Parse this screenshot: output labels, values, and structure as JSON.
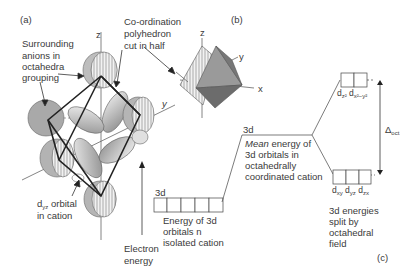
{
  "panel_labels": {
    "a": "(a)",
    "b": "(b)",
    "c": "(c)"
  },
  "part_a": {
    "axis_z": "z",
    "axis_y": "y",
    "label_anions": [
      "Surrounding",
      "anions in",
      "octahedra",
      "grouping"
    ],
    "label_polyhedron": [
      "Co-ordination",
      "polyhedron",
      "cut in half"
    ],
    "label_orbital_prefix": "d",
    "label_orbital_sub": "yz",
    "label_orbital_suffix": " orbital",
    "label_orbital_line2": "in cation"
  },
  "part_b": {
    "axis_z": "z",
    "axis_y": "y",
    "axis_x": "x"
  },
  "part_c": {
    "energy_axis_label": [
      "Electron",
      "energy"
    ],
    "isolated": {
      "level_label": "3d",
      "box_count": 5,
      "caption": [
        "Energy of 3d",
        "orbitals n",
        "isolated cation"
      ]
    },
    "mean": {
      "level_label": "3d",
      "caption_italic": "Mean",
      "caption_rest": " energy of",
      "caption_lines": [
        "3d orbitals in",
        "octahedrally",
        "coordinated cation"
      ]
    },
    "eg": {
      "box_count": 2,
      "orbitals": [
        {
          "d": "d",
          "sub": "z²"
        },
        {
          "d": "d",
          "sub": "x²−y²"
        }
      ]
    },
    "t2g": {
      "box_count": 3,
      "orbitals": [
        {
          "d": "d",
          "sub": "xy"
        },
        {
          "d": "d",
          "sub": "yz"
        },
        {
          "d": "d",
          "sub": "zx"
        }
      ],
      "caption": [
        "3d energies",
        "split by",
        "octahedral",
        "field"
      ]
    },
    "splitting": {
      "symbol": "Δ",
      "sub": "oct"
    }
  }
}
